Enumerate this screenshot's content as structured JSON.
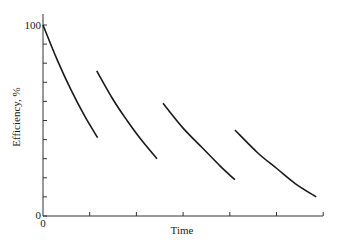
{
  "chart_data": {
    "type": "line",
    "title": "",
    "xlabel": "Time",
    "ylabel": "Efficiency, %",
    "ylim": [
      0,
      100
    ],
    "xlim": [
      0,
      6
    ],
    "grid": false,
    "legend": null,
    "y_tick_labels": [
      "0",
      "100"
    ],
    "x_tick_labels": [
      "0"
    ],
    "y_minor_ticks": [
      10,
      20,
      30,
      40,
      50,
      60,
      70,
      80,
      90
    ],
    "x_ticks": [
      1,
      2,
      3,
      4,
      5,
      6
    ],
    "series": [
      {
        "name": "cycle-1",
        "x": [
          0,
          0.3,
          0.6,
          0.9,
          1.17
        ],
        "y": [
          100,
          82,
          66,
          52,
          41
        ]
      },
      {
        "name": "cycle-2",
        "x": [
          1.15,
          1.5,
          1.8,
          2.1,
          2.44
        ],
        "y": [
          76,
          61,
          50,
          40,
          30
        ]
      },
      {
        "name": "cycle-3",
        "x": [
          2.57,
          3.0,
          3.4,
          3.8,
          4.11
        ],
        "y": [
          59,
          46,
          36,
          26,
          19
        ]
      },
      {
        "name": "cycle-4",
        "x": [
          4.11,
          4.6,
          5.0,
          5.4,
          5.85
        ],
        "y": [
          45,
          33,
          25,
          17,
          10
        ]
      }
    ],
    "color": "#1a1a1a"
  }
}
